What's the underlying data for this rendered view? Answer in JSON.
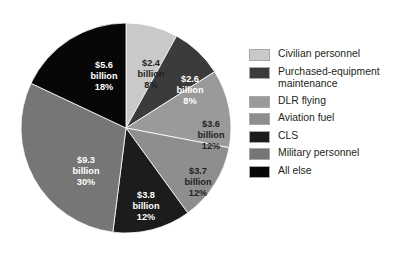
{
  "chart_data": {
    "type": "pie",
    "title": "",
    "subtitle": "",
    "xlabel": "",
    "ylabel": "",
    "units": "billion dollars",
    "legend_position": "right",
    "grid": false,
    "start_angle_deg": 0,
    "direction": "clockwise",
    "categories": [
      "Civilian personnel",
      "Purchased-equipment maintenance",
      "DLR flying",
      "Aviation fuel",
      "CLS",
      "Military personnel",
      "All else"
    ],
    "values": [
      2.4,
      2.6,
      3.6,
      3.7,
      3.8,
      9.3,
      5.6
    ],
    "percentages": [
      8,
      8,
      12,
      12,
      12,
      30,
      18
    ],
    "colors": [
      "#c9c9c9",
      "#3b3b3b",
      "#9a9a9a",
      "#8e8e8e",
      "#1c1c1c",
      "#767676",
      "#070707"
    ],
    "slices": [
      {
        "name": "Civilian personnel",
        "value": 2.4,
        "percent": 8,
        "color": "#c9c9c9",
        "label_amount": "$2.4",
        "label_unit": "billion",
        "label_percent": "8%",
        "label_color": "#231f20",
        "label_x": 133,
        "label_y": 56
      },
      {
        "name": "Purchased-equipment maintenance",
        "value": 2.6,
        "percent": 8,
        "color": "#3b3b3b",
        "label_amount": "$2.6",
        "label_unit": "billion",
        "label_percent": "8%",
        "label_color": "#ffffff",
        "label_x": 172,
        "label_y": 72
      },
      {
        "name": "DLR flying",
        "value": 3.6,
        "percent": 12,
        "color": "#9a9a9a",
        "label_amount": "$3.6",
        "label_unit": "billion",
        "label_percent": "12%",
        "label_color": "#231f20",
        "label_x": 193,
        "label_y": 117
      },
      {
        "name": "Aviation fuel",
        "value": 3.7,
        "percent": 12,
        "color": "#8e8e8e",
        "label_amount": "$3.7",
        "label_unit": "billion",
        "label_percent": "12%",
        "label_color": "#231f20",
        "label_x": 180,
        "label_y": 164
      },
      {
        "name": "CLS",
        "value": 3.8,
        "percent": 12,
        "color": "#1c1c1c",
        "label_amount": "$3.8",
        "label_unit": "billion",
        "label_percent": "12%",
        "label_color": "#ffffff",
        "label_x": 128,
        "label_y": 188
      },
      {
        "name": "Military personnel",
        "value": 9.3,
        "percent": 30,
        "color": "#767676",
        "label_amount": "$9.3",
        "label_unit": "billion",
        "label_percent": "30%",
        "label_color": "#ffffff",
        "label_x": 68,
        "label_y": 153
      },
      {
        "name": "All else",
        "value": 5.6,
        "percent": 18,
        "color": "#070707",
        "label_amount": "$5.6",
        "label_unit": "billion",
        "label_percent": "18%",
        "label_color": "#ffffff",
        "label_x": 86,
        "label_y": 58
      }
    ]
  },
  "legend": {
    "items": [
      {
        "label": "Civilian personnel",
        "color": "#c9c9c9"
      },
      {
        "label": "Purchased-equipment\nmaintenance",
        "color": "#3b3b3b"
      },
      {
        "label": "DLR flying",
        "color": "#9a9a9a"
      },
      {
        "label": "Aviation fuel",
        "color": "#8e8e8e"
      },
      {
        "label": "CLS",
        "color": "#1c1c1c"
      },
      {
        "label": "Military personnel",
        "color": "#767676"
      },
      {
        "label": "All else",
        "color": "#070707"
      }
    ]
  },
  "geometry": {
    "center_x": 108,
    "center_y": 118,
    "radius": 105
  }
}
